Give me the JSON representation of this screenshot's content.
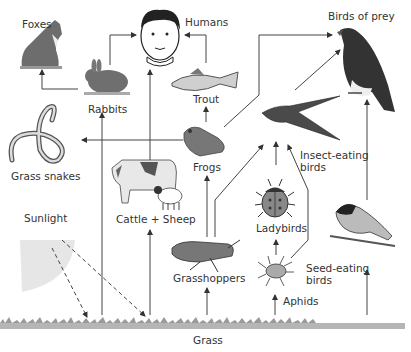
{
  "organisms": {
    "humans": "Humans",
    "foxes": "Foxes",
    "rabbits": "Rabbits",
    "trout": "Trout",
    "birds_of_prey": "Birds of prey",
    "grass_snakes": "Grass snakes",
    "frogs": "Frogs",
    "insect_eating_birds_1": "Insect-eating",
    "insect_eating_birds_2": "birds",
    "cattle_sheep": "Cattle + Sheep",
    "ladybirds": "Ladybirds",
    "sunlight": "Sunlight",
    "grasshoppers": "Grasshoppers",
    "seed_eating_birds_1": "Seed-eating",
    "seed_eating_birds_2": "birds",
    "aphids": "Aphids",
    "grass": "Grass"
  },
  "links": [
    {
      "from": "Rabbits",
      "to": "Foxes"
    },
    {
      "from": "Rabbits",
      "to": "Humans"
    },
    {
      "from": "Trout",
      "to": "Humans"
    },
    {
      "from": "Cattle + Sheep",
      "to": "Humans"
    },
    {
      "from": "Frogs",
      "to": "Trout"
    },
    {
      "from": "Frogs",
      "to": "Grass snakes"
    },
    {
      "from": "Frogs",
      "to": "Birds of prey"
    },
    {
      "from": "Insect-eating birds",
      "to": "Birds of prey"
    },
    {
      "from": "Seed-eating birds",
      "to": "Birds of prey"
    },
    {
      "from": "Grasshoppers",
      "to": "Frogs"
    },
    {
      "from": "Grasshoppers",
      "to": "Insect-eating birds"
    },
    {
      "from": "Ladybirds",
      "to": "Insect-eating birds"
    },
    {
      "from": "Aphids",
      "to": "Ladybirds"
    },
    {
      "from": "Aphids",
      "to": "Insect-eating birds"
    },
    {
      "from": "Grass",
      "to": "Rabbits"
    },
    {
      "from": "Grass",
      "to": "Cattle + Sheep"
    },
    {
      "from": "Grass",
      "to": "Grasshoppers"
    },
    {
      "from": "Grass",
      "to": "Aphids"
    },
    {
      "from": "Grass",
      "to": "Seed-eating birds"
    },
    {
      "from": "Sunlight",
      "to": "Grass",
      "style": "dashed"
    }
  ]
}
